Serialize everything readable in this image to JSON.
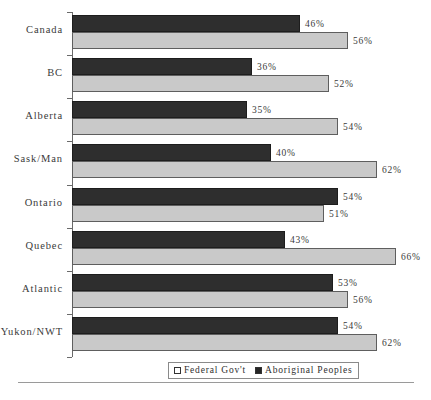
{
  "chart_data": {
    "type": "bar",
    "orientation": "horizontal",
    "title": "",
    "xlabel": "",
    "ylabel": "",
    "xlim": [
      0,
      68
    ],
    "grid": false,
    "value_suffix": "%",
    "legend_position": "bottom",
    "categories": [
      "Canada",
      "BC",
      "Alberta",
      "Sask/Man",
      "Ontario",
      "Quebec",
      "Atlantic",
      "Yukon/NWT"
    ],
    "series": [
      {
        "name": "Aboriginal Peoples",
        "color": "#2e2e2e",
        "values": [
          46,
          36,
          35,
          40,
          54,
          43,
          53,
          54
        ],
        "labels": [
          "46%",
          "36%",
          "35%",
          "40%",
          "54%",
          "43%",
          "53%",
          "54%"
        ]
      },
      {
        "name": "Federal Gov't",
        "color": "#c9c9c9",
        "values": [
          56,
          52,
          54,
          62,
          51,
          66,
          56,
          62
        ],
        "labels": [
          "56%",
          "52%",
          "54%",
          "62%",
          "51%",
          "66%",
          "56%",
          "62%"
        ]
      }
    ]
  },
  "legend": {
    "items": [
      {
        "label": "Federal Gov't",
        "swatch": "open"
      },
      {
        "label": "Aboriginal Peoples",
        "swatch": "filled"
      }
    ]
  }
}
